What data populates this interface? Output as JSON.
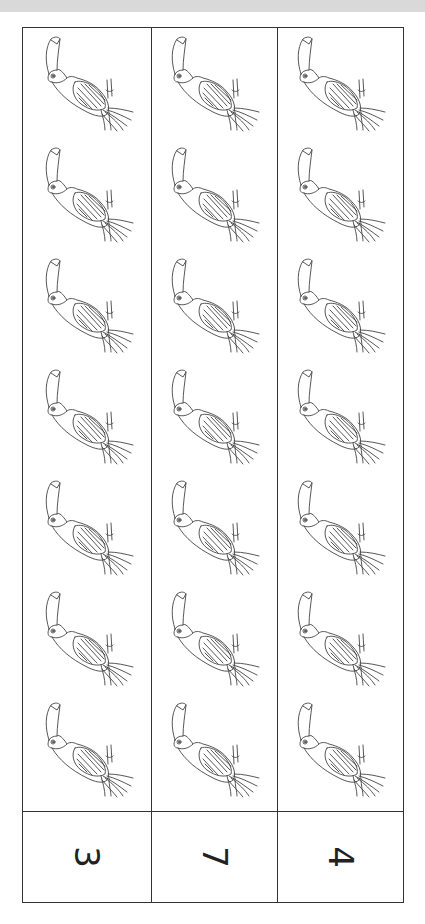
{
  "header": {
    "bar_color": "#d9d9d9",
    "text": ""
  },
  "worksheet": {
    "type": "counting-worksheet",
    "orientation": "rotated-90",
    "columns": [
      {
        "count_label": "3",
        "pictures": 7,
        "picture": "toucan"
      },
      {
        "count_label": "7",
        "pictures": 7,
        "picture": "toucan"
      },
      {
        "count_label": "4",
        "pictures": 7,
        "picture": "toucan"
      }
    ],
    "line_color": "#333333"
  }
}
